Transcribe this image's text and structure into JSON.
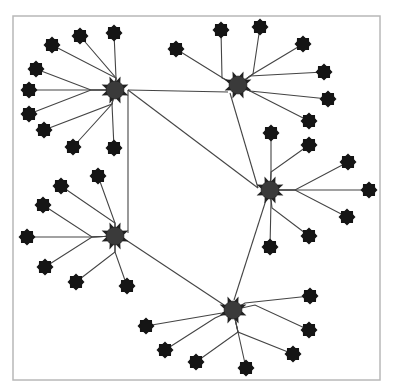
{
  "diagram": {
    "type": "network-graph",
    "canvas": {
      "width": 394,
      "height": 392
    },
    "frame": {
      "x": 13,
      "y": 16,
      "width": 367,
      "height": 364
    },
    "colors": {
      "edge": "#444444",
      "hub": "#3a3a3a",
      "leaf": "#151515",
      "frame": "#b8b8b8",
      "background": "#ffffff"
    },
    "hubs": [
      {
        "id": "h1",
        "x": 115,
        "y": 90,
        "r": 9
      },
      {
        "id": "h2",
        "x": 238,
        "y": 85,
        "r": 9
      },
      {
        "id": "h3",
        "x": 270,
        "y": 190,
        "r": 9
      },
      {
        "id": "h4",
        "x": 115,
        "y": 236,
        "r": 9
      },
      {
        "id": "h5",
        "x": 233,
        "y": 310,
        "r": 9
      }
    ],
    "hub_links": [
      {
        "from": "h1",
        "to": "h2",
        "points": [
          [
            128,
            90
          ],
          [
            228,
            92
          ]
        ]
      },
      {
        "from": "h1",
        "to": "h3",
        "points": [
          [
            128,
            90
          ],
          [
            258,
            188
          ]
        ]
      },
      {
        "from": "h2",
        "to": "h3",
        "points": [
          [
            230,
            93
          ],
          [
            258,
            188
          ]
        ]
      },
      {
        "from": "h1",
        "to": "h4",
        "points": [
          [
            128,
            90
          ],
          [
            128,
            233
          ]
        ]
      },
      {
        "from": "h4",
        "to": "h5",
        "points": [
          [
            126,
            240
          ],
          [
            224,
            305
          ]
        ]
      },
      {
        "from": "h3",
        "to": "h5",
        "points": [
          [
            266,
            200
          ],
          [
            234,
            300
          ]
        ]
      }
    ],
    "clusters": [
      {
        "hub": "h1",
        "leaves": [
          {
            "x": 52,
            "y": 45,
            "via": [
              116,
              78
            ]
          },
          {
            "x": 80,
            "y": 36,
            "via": [
              116,
              78
            ]
          },
          {
            "x": 114,
            "y": 33,
            "via": [
              116,
              78
            ]
          },
          {
            "x": 36,
            "y": 69,
            "via": [
              91,
              90
            ]
          },
          {
            "x": 29,
            "y": 90,
            "via": [
              91,
              90
            ]
          },
          {
            "x": 29,
            "y": 114,
            "via": [
              91,
              90
            ]
          },
          {
            "x": 44,
            "y": 130,
            "via": [
              112,
              104
            ]
          },
          {
            "x": 73,
            "y": 147,
            "via": [
              112,
              104
            ]
          },
          {
            "x": 114,
            "y": 148,
            "via": [
              112,
              104
            ]
          }
        ]
      },
      {
        "hub": "h2",
        "leaves": [
          {
            "x": 176,
            "y": 49,
            "via": [
              226,
              80
            ]
          },
          {
            "x": 221,
            "y": 30,
            "via": [
              222,
              78
            ]
          },
          {
            "x": 260,
            "y": 27,
            "via": [
              253,
              74
            ]
          },
          {
            "x": 303,
            "y": 44,
            "via": [
              253,
              74
            ]
          },
          {
            "x": 324,
            "y": 72,
            "via": [
              250,
              76
            ]
          },
          {
            "x": 328,
            "y": 99,
            "via": [
              250,
              91
            ]
          },
          {
            "x": 309,
            "y": 121,
            "via": [
              250,
              91
            ]
          }
        ]
      },
      {
        "hub": "h3",
        "leaves": [
          {
            "x": 271,
            "y": 133,
            "via": [
              271,
              178
            ]
          },
          {
            "x": 309,
            "y": 145,
            "via": [
              271,
              172
            ]
          },
          {
            "x": 348,
            "y": 162,
            "via": [
              295,
              190
            ]
          },
          {
            "x": 369,
            "y": 190,
            "via": [
              295,
              190
            ]
          },
          {
            "x": 347,
            "y": 217,
            "via": [
              295,
              190
            ]
          },
          {
            "x": 309,
            "y": 236,
            "via": [
              272,
              208
            ]
          },
          {
            "x": 270,
            "y": 247,
            "via": [
              271,
              202
            ]
          }
        ]
      },
      {
        "hub": "h4",
        "leaves": [
          {
            "x": 98,
            "y": 176,
            "via": [
              115,
              223
            ]
          },
          {
            "x": 61,
            "y": 186,
            "via": [
              115,
              223
            ]
          },
          {
            "x": 43,
            "y": 205,
            "via": [
              92,
              237
            ]
          },
          {
            "x": 27,
            "y": 237,
            "via": [
              92,
              237
            ]
          },
          {
            "x": 45,
            "y": 267,
            "via": [
              92,
              237
            ]
          },
          {
            "x": 76,
            "y": 282,
            "via": [
              115,
              252
            ]
          },
          {
            "x": 127,
            "y": 286,
            "via": [
              115,
              252
            ]
          }
        ]
      },
      {
        "hub": "h5",
        "leaves": [
          {
            "x": 146,
            "y": 326,
            "via": [
              222,
              313
            ]
          },
          {
            "x": 165,
            "y": 350,
            "via": [
              215,
              318
            ]
          },
          {
            "x": 196,
            "y": 362,
            "via": [
              238,
              332
            ]
          },
          {
            "x": 246,
            "y": 368,
            "via": [
              238,
              332
            ]
          },
          {
            "x": 293,
            "y": 354,
            "via": [
              238,
              332
            ]
          },
          {
            "x": 309,
            "y": 330,
            "via": [
              255,
              305
            ]
          },
          {
            "x": 310,
            "y": 296,
            "via": [
              245,
              303
            ]
          }
        ]
      }
    ]
  }
}
